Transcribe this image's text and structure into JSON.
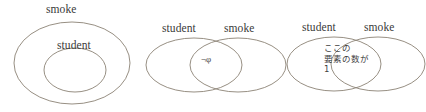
{
  "figure": {
    "kind": "venn-diagram-set",
    "background_color": "#ffffff",
    "stroke_color": "#8b8275",
    "text_color": "#3a3a3a",
    "diagram_count": 3
  },
  "diagram1": {
    "name": "nested-venn",
    "description": "student fully contained inside smoke",
    "outer_label": "smoke",
    "inner_label": "student"
  },
  "diagram2": {
    "name": "overlapping-venn-empty-intersection",
    "left_label": "student",
    "right_label": "smoke",
    "intersection_symbol": "¬φ"
  },
  "diagram3": {
    "name": "overlapping-venn-counted-intersection",
    "left_label": "student",
    "right_label": "smoke",
    "annotation_line1": "ここの",
    "annotation_line2": "要素の数が",
    "annotation_line3": "1"
  }
}
